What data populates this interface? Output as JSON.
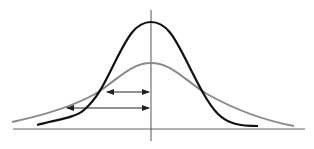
{
  "diagram": {
    "title": "",
    "colors": {
      "narrow_curve": "#111111",
      "wide_curve": "#8a8a8a",
      "axes": "#555555",
      "arrows": "#222222"
    },
    "axes": {
      "vertical": {
        "x": 151,
        "y1": 10,
        "y2": 141
      },
      "horizontal": {
        "y": 129,
        "x1": 13,
        "x2": 305
      }
    },
    "curves": [
      {
        "name": "narrow-distribution",
        "peak": [
          151,
          22
        ],
        "start": [
          37,
          125
        ],
        "end": [
          258,
          126
        ]
      },
      {
        "name": "wide-distribution",
        "peak": [
          151,
          63
        ],
        "start": [
          12,
          122
        ],
        "end": [
          294,
          126
        ]
      }
    ],
    "arrows": [
      {
        "name": "upper-width-arrow",
        "y": 92,
        "x1": 107,
        "x2": 149
      },
      {
        "name": "lower-width-arrow",
        "y": 108,
        "x1": 67,
        "x2": 149
      }
    ]
  }
}
